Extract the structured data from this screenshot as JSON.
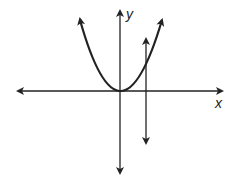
{
  "diagram": {
    "type": "graph",
    "axes": {
      "x_label": "x",
      "y_label": "y"
    },
    "curves": [
      {
        "name": "parabola",
        "shape": "upward parabola with vertex at origin"
      },
      {
        "name": "vertical-line",
        "shape": "vertical line right of y-axis crossing parabola once"
      }
    ],
    "colors": {
      "stroke": "#222222",
      "background": "#ffffff"
    }
  }
}
